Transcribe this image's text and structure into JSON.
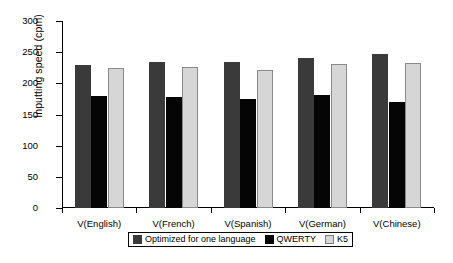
{
  "chart_data": {
    "type": "bar",
    "title": "",
    "xlabel": "",
    "ylabel": "Inputting speed (cpm)",
    "categories": [
      "V(English)",
      "V(French)",
      "V(Spanish)",
      "V(German)",
      "V(Chinese)"
    ],
    "series": [
      {
        "name": "Optimized for one language",
        "color": "#3a3a3a",
        "values": [
          230,
          235,
          235,
          240,
          247
        ]
      },
      {
        "name": "QWERTY",
        "color": "#050505",
        "values": [
          180,
          178,
          175,
          181,
          170
        ]
      },
      {
        "name": "K5",
        "color": "#d6d6d6",
        "values": [
          225,
          226,
          221,
          231,
          233
        ]
      }
    ],
    "ylim": [
      0,
      300
    ],
    "ytick_values": [
      0,
      50,
      100,
      150,
      200,
      250,
      300
    ],
    "ytick_labels": [
      "0",
      "50",
      "100",
      "150",
      "200",
      "250",
      "300"
    ],
    "grid": false,
    "legend_position": "bottom-center"
  }
}
